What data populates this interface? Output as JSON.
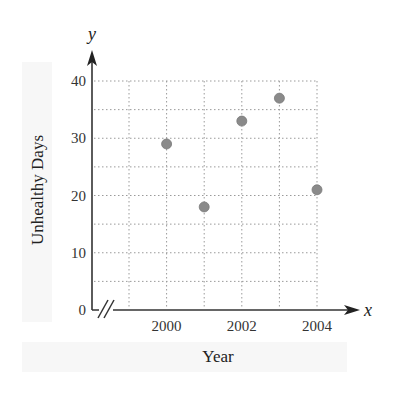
{
  "chart_data": {
    "type": "scatter",
    "title": "",
    "xlabel": "Year",
    "ylabel": "Unhealthy Days",
    "x_axis_var": "x",
    "y_axis_var": "y",
    "x": [
      2000,
      2001,
      2002,
      2003,
      2004
    ],
    "y": [
      29,
      18,
      33,
      37,
      21
    ],
    "x_ticks": [
      "2000",
      "2002",
      "2004"
    ],
    "y_ticks": [
      "0",
      "10",
      "20",
      "30",
      "40"
    ],
    "xlim": [
      1999,
      2004
    ],
    "ylim": [
      0,
      40
    ],
    "grid": true,
    "grid_style": "dotted",
    "axis_break": true,
    "marker_color": "#8a8a8a",
    "legend": null
  }
}
